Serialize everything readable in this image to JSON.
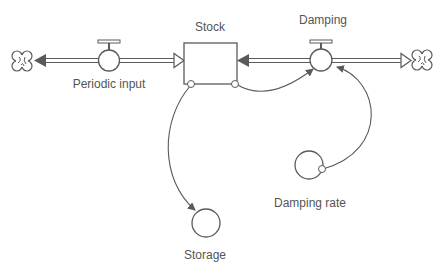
{
  "diagram": {
    "type": "stock-and-flow",
    "colors": {
      "line": "#5a5a5a",
      "text": "#555555",
      "background": "#ffffff"
    },
    "stocks": [
      {
        "id": "stock",
        "label": "Stock"
      }
    ],
    "flows": [
      {
        "id": "periodic-input",
        "label": "Periodic input",
        "from": "cloud-left",
        "to": "stock",
        "biflow": true
      },
      {
        "id": "damping",
        "label": "Damping",
        "from": "stock",
        "to": "cloud-right",
        "biflow": true
      }
    ],
    "converters": [
      {
        "id": "damping-rate",
        "label": "Damping rate"
      },
      {
        "id": "storage",
        "label": "Storage"
      }
    ],
    "connectors": [
      {
        "from": "stock",
        "to": "damping"
      },
      {
        "from": "stock",
        "to": "storage"
      },
      {
        "from": "damping-rate",
        "to": "damping"
      }
    ],
    "clouds": [
      {
        "id": "cloud-left",
        "icon": "cloud-icon"
      },
      {
        "id": "cloud-right",
        "icon": "cloud-icon"
      }
    ]
  }
}
